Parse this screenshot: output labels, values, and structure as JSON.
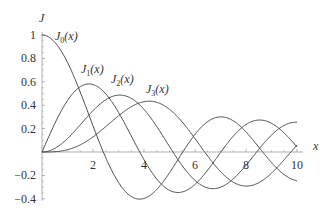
{
  "chart_data": {
    "type": "line",
    "title": "",
    "xlabel": "x",
    "ylabel": "J",
    "xlim": [
      0,
      10
    ],
    "ylim": [
      -0.4,
      1.0
    ],
    "xticks": [
      2,
      4,
      6,
      8,
      10
    ],
    "xtick_labels": [
      "2",
      "4",
      "6",
      "8",
      "10"
    ],
    "yticks": [
      -0.4,
      -0.2,
      0.2,
      0.4,
      0.6,
      0.8,
      1
    ],
    "ytick_labels": [
      "−0.4",
      "−0.2",
      "0.2",
      "0.4",
      "0.6",
      "0.8",
      "1"
    ],
    "grid": false,
    "legend": "inline labels",
    "series": [
      {
        "name": "J0(x)",
        "order": 0,
        "label_main": "J",
        "label_sub": "0",
        "label_arg": "(x)",
        "function": "Bessel J of order 0",
        "x": [
          0,
          1,
          2,
          3,
          4,
          5,
          6,
          7,
          8,
          9,
          10
        ],
        "values": [
          1.0,
          0.765,
          0.224,
          -0.26,
          -0.397,
          -0.178,
          0.151,
          0.3,
          0.172,
          -0.09,
          -0.246
        ]
      },
      {
        "name": "J1(x)",
        "order": 1,
        "label_main": "J",
        "label_sub": "1",
        "label_arg": "(x)",
        "function": "Bessel J of order 1",
        "x": [
          0,
          1,
          2,
          3,
          4,
          5,
          6,
          7,
          8,
          9,
          10
        ],
        "values": [
          0.0,
          0.44,
          0.577,
          0.339,
          -0.066,
          -0.328,
          -0.277,
          -0.005,
          0.235,
          0.245,
          0.043
        ]
      },
      {
        "name": "J2(x)",
        "order": 2,
        "label_main": "J",
        "label_sub": "2",
        "label_arg": "(x)",
        "function": "Bessel J of order 2",
        "x": [
          0,
          1,
          2,
          3,
          4,
          5,
          6,
          7,
          8,
          9,
          10
        ],
        "values": [
          0.0,
          0.115,
          0.353,
          0.486,
          0.364,
          0.047,
          -0.243,
          -0.301,
          -0.113,
          0.145,
          0.255
        ]
      },
      {
        "name": "J3(x)",
        "order": 3,
        "label_main": "J",
        "label_sub": "3",
        "label_arg": "(x)",
        "function": "Bessel J of order 3",
        "x": [
          0,
          1,
          2,
          3,
          4,
          5,
          6,
          7,
          8,
          9,
          10
        ],
        "values": [
          0.0,
          0.02,
          0.129,
          0.309,
          0.43,
          0.365,
          0.115,
          -0.168,
          -0.291,
          -0.181,
          0.058
        ]
      }
    ],
    "colors": {
      "curve": "#4a4a4a",
      "axis": "#b0b0b0",
      "text": "#333333"
    }
  }
}
